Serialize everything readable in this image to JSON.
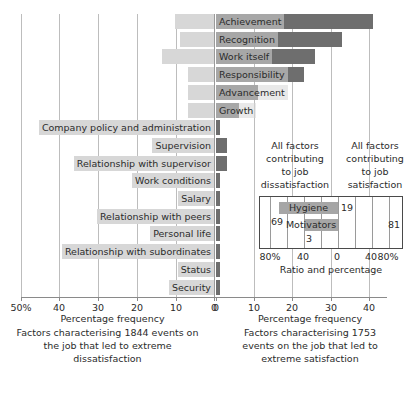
{
  "chart_data": {
    "type": "bar",
    "title": "",
    "orientation": "horizontal-diverging",
    "categories": [
      "Achievement",
      "Recognition",
      "Work itself",
      "Responsibility",
      "Advancement",
      "Growth",
      "Company policy and administration",
      "Supervision",
      "Relationship with supervisor",
      "Work conditions",
      "Salary",
      "Relationship with peers",
      "Personal life",
      "Relationship with subordinates",
      "Status",
      "Security"
    ],
    "series": [
      {
        "name": "Factors characterising 1753 events on the job that led to extreme satisfaction",
        "side": "right",
        "values": [
          41,
          33,
          26,
          23,
          11,
          6,
          1,
          3,
          3,
          1,
          1,
          1,
          1,
          1,
          1,
          1
        ]
      },
      {
        "name": "Factors characterising 1844 events on the job that led to extreme dissatisfaction",
        "side": "left",
        "values": [
          2,
          2,
          2,
          1,
          1,
          1,
          31,
          20,
          20,
          11,
          17,
          8,
          6,
          6,
          4,
          2
        ]
      }
    ],
    "xlabel_left": "Percentage frequency",
    "xlabel_right": "Percentage frequency",
    "xticks_left": [
      "50%",
      "40",
      "30",
      "20",
      "10",
      "0"
    ],
    "xticks_right": [
      "0",
      "10",
      "20",
      "30",
      "40"
    ],
    "xlim_left": [
      50,
      0
    ],
    "xlim_right": [
      0,
      45
    ],
    "grid": true,
    "legend": "none",
    "caption_left": "Factors characterising 1844 events on the job that led to extreme dissatisfaction",
    "caption_right": "Factors characterising 1753 events on the job that led to extreme satisfaction"
  },
  "axes": {
    "left": {
      "ticks": [
        "50%",
        "40",
        "30",
        "20",
        "10",
        "0"
      ],
      "title": "Percentage frequency",
      "caption_lines": [
        "Factors characterising 1844 events on",
        "the job that led to extreme",
        "dissatisfaction"
      ]
    },
    "right": {
      "ticks": [
        "0",
        "10",
        "20",
        "30",
        "40"
      ],
      "title": "Percentage frequency",
      "caption_lines": [
        "Factors characterising 1753",
        "events on the job that led to",
        "extreme satisfaction"
      ]
    }
  },
  "rows": [
    {
      "label": "Achievement",
      "right": 41,
      "left": 0
    },
    {
      "label": "Recognition",
      "right": 33,
      "left": 0
    },
    {
      "label": "Work itself",
      "right": 26,
      "left": 0
    },
    {
      "label": "Responsibility",
      "right": 23,
      "left": 0
    },
    {
      "label": "Advancement",
      "right": 11,
      "left": 0
    },
    {
      "label": "Growth",
      "right": 6,
      "left": 0
    },
    {
      "label": "Company policy and administration",
      "right": 1,
      "left": 0
    },
    {
      "label": "Supervision",
      "right": 3,
      "left": 0
    },
    {
      "label": "Relationship with supervisor",
      "right": 3,
      "left": 0
    },
    {
      "label": "Work conditions",
      "right": 1,
      "left": 0
    },
    {
      "label": "Salary",
      "right": 6,
      "left": 0
    },
    {
      "label": "Relationship with peers",
      "right": 0,
      "left": 0
    },
    {
      "label": "Personal life",
      "right": 0,
      "left": 0
    },
    {
      "label": "Relationship with subordinates",
      "right": 0,
      "left": 0
    },
    {
      "label": "Status",
      "right": 0,
      "left": 0
    },
    {
      "label": "Security",
      "right": 0,
      "left": 0
    }
  ],
  "inset": {
    "heading_left_lines": [
      "All factors",
      "contributing",
      "to job",
      "dissatisfaction"
    ],
    "heading_right_lines": [
      "All factors",
      "contributing",
      "to job",
      "satisfaction"
    ],
    "bars": [
      {
        "name": "Hygiene",
        "left_value": 69,
        "right_value": 19
      },
      {
        "name": "Motivators",
        "left_value": 3,
        "right_value": 81
      }
    ],
    "value_labels": {
      "hygiene_left": "69",
      "hygiene_right": "19",
      "motivators_left": "3",
      "motivators_right": "81"
    },
    "ticks": [
      "80%",
      "40",
      "0",
      "40",
      "80%"
    ],
    "axis_title": "Ratio and percentage"
  },
  "colors": {
    "bar_dark": "#6e6e6e",
    "bar_light": "#a6a6a6",
    "label_background": "#d7d7d7",
    "gridline": "#bdbdbd",
    "axis": "#8a8a8a",
    "text": "#2b2b2b",
    "background": "#ffffff"
  }
}
